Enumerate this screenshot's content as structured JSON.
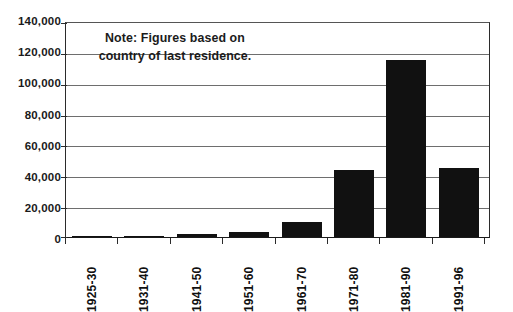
{
  "chart_data": {
    "type": "bar",
    "title": "",
    "subtitle": "",
    "xlabel": "",
    "ylabel": "",
    "categories": [
      "1925-30",
      "1931-40",
      "1941-50",
      "1951-60",
      "1961-70",
      "1971-80",
      "1981-90",
      "1991-96"
    ],
    "values": [
      700,
      600,
      2000,
      3500,
      10000,
      44000,
      115500,
      45000
    ],
    "ylim": [
      0,
      140000
    ],
    "ytick_labels": [
      "140,000",
      "120,000",
      "100,000",
      "80,000",
      "60,000",
      "40,000",
      "20,000",
      "0"
    ],
    "ytick_values": [
      140000,
      120000,
      100000,
      80000,
      60000,
      40000,
      20000,
      0
    ],
    "ytick_step": 20000,
    "grid": true,
    "grid_axis": "y",
    "legend": false,
    "legend_position": "none",
    "bar_color": "#111111",
    "axis_color": "#2b2b2b",
    "gridline_color": "#6e6e6e",
    "annotations": [
      {
        "name": "note",
        "text": "Note: Figures based on country of last residence.",
        "line1": "Note: Figures based on",
        "line2": "country of last residence."
      }
    ]
  }
}
